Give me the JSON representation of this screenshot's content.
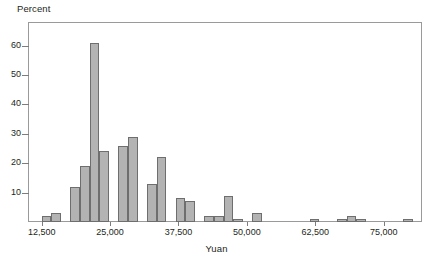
{
  "chart_data": {
    "type": "bar",
    "title": "",
    "subtitle": "",
    "xlabel": "Yuan",
    "ylabel": "Percent",
    "grid": false,
    "legend": null,
    "xlim": [
      10000,
      82000
    ],
    "ylim": [
      0,
      68
    ],
    "y_ticks": [
      10,
      20,
      30,
      40,
      50,
      60
    ],
    "y_tick_labels": [
      "10",
      "20",
      "30",
      "40",
      "50",
      "60"
    ],
    "x_ticks": [
      12500,
      25000,
      37500,
      50000,
      62500,
      75000
    ],
    "x_tick_labels": [
      "12,500",
      "25,000",
      "37,500",
      "50,000",
      "62,500",
      "75,000"
    ],
    "bin_width": 1766,
    "bar_fill": "#b3b3b3",
    "bar_edge": "#6e6e6e",
    "categories": [
      "12,500",
      "14,250",
      "16,000",
      "17,750",
      "19,500",
      "21,250",
      "23,000",
      "24,750",
      "26,500",
      "28,250",
      "30,000",
      "31,750",
      "33,500",
      "35,250",
      "37,000",
      "38,750",
      "40,500",
      "42,250",
      "44,000",
      "45,750",
      "47,500",
      "49,250",
      "51,000",
      "52,750",
      "54,500",
      "56,250",
      "61,500",
      "66,500",
      "68,250",
      "70,000",
      "78,500"
    ],
    "values": [
      2,
      3,
      0,
      12,
      19,
      61,
      24,
      0,
      26,
      29,
      0,
      13,
      22,
      0,
      8,
      7,
      0,
      2,
      2,
      9,
      1,
      0,
      3,
      0,
      0,
      0,
      1,
      1,
      2,
      1,
      1
    ],
    "bars": [
      {
        "x": 12500,
        "value": 2
      },
      {
        "x": 14250,
        "value": 3
      },
      {
        "x": 17750,
        "value": 12
      },
      {
        "x": 19500,
        "value": 19
      },
      {
        "x": 21250,
        "value": 61
      },
      {
        "x": 23000,
        "value": 24
      },
      {
        "x": 26500,
        "value": 26
      },
      {
        "x": 28250,
        "value": 29
      },
      {
        "x": 31750,
        "value": 13
      },
      {
        "x": 33500,
        "value": 22
      },
      {
        "x": 37000,
        "value": 8
      },
      {
        "x": 38750,
        "value": 7
      },
      {
        "x": 42250,
        "value": 2
      },
      {
        "x": 44000,
        "value": 2
      },
      {
        "x": 45750,
        "value": 9
      },
      {
        "x": 47500,
        "value": 1
      },
      {
        "x": 51000,
        "value": 3
      },
      {
        "x": 61500,
        "value": 1
      },
      {
        "x": 66500,
        "value": 1
      },
      {
        "x": 68250,
        "value": 2
      },
      {
        "x": 70000,
        "value": 1
      },
      {
        "x": 78500,
        "value": 1
      }
    ]
  }
}
